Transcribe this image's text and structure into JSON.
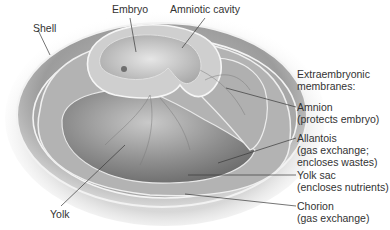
{
  "diagram": {
    "colors": {
      "background": "#ffffff",
      "text": "#333333",
      "leader": "#3a3a3a",
      "egg_shade": "#9a9a9a",
      "membrane_highlight": "#f4f4f4"
    }
  },
  "labels": {
    "embryo": "Embryo",
    "amniotic_cavity": "Amniotic cavity",
    "shell": "Shell",
    "yolk": "Yolk",
    "extraembryonic_heading_1": "Extraembryonic",
    "extraembryonic_heading_2": "membranes:",
    "amnion": {
      "name": "Amnion",
      "desc": "(protects embryo)"
    },
    "allantois": {
      "name": "Allantois",
      "desc1": "(gas exchange;",
      "desc2": "encloses wastes)"
    },
    "yolk_sac": {
      "name": "Yolk sac",
      "desc": "(encloses nutrients)"
    },
    "chorion": {
      "name": "Chorion",
      "desc": "(gas exchange)"
    }
  }
}
